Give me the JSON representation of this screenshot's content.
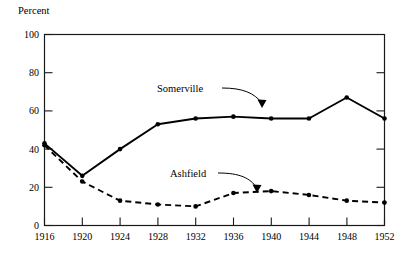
{
  "chart_data": {
    "type": "line",
    "title": "",
    "xlabel": "",
    "ylabel": "Percent",
    "ylabel_position": "top-left",
    "x": [
      1916,
      1920,
      1924,
      1928,
      1932,
      1936,
      1940,
      1944,
      1948,
      1952
    ],
    "xticklabels": [
      "1916",
      "1920",
      "1924",
      "1928",
      "1932",
      "1936",
      "1940",
      "1944",
      "1948",
      "1952"
    ],
    "yticklabels": [
      "0",
      "20",
      "40",
      "60",
      "80",
      "100"
    ],
    "yticks": [
      0,
      20,
      40,
      60,
      80,
      100
    ],
    "xlim": [
      1916,
      1952
    ],
    "ylim": [
      0,
      100
    ],
    "grid": false,
    "legend": "none",
    "series": [
      {
        "name": "Somerville",
        "style": "solid",
        "marker": "filled-circle",
        "values": [
          43,
          26,
          40,
          53,
          56,
          57,
          56,
          56,
          67,
          56
        ]
      },
      {
        "name": "Ashfield",
        "style": "dashed",
        "marker": "filled-circle",
        "values": [
          42,
          23,
          13,
          11,
          10,
          17,
          18,
          16,
          13,
          12
        ]
      }
    ],
    "annotations": [
      {
        "text": "Somerville",
        "target_x": 1940,
        "target_y": 56,
        "arrow": "curved-down-right"
      },
      {
        "text": "Ashfield",
        "target_x": 1938,
        "target_y": 18,
        "arrow": "curved-down-right"
      }
    ]
  }
}
